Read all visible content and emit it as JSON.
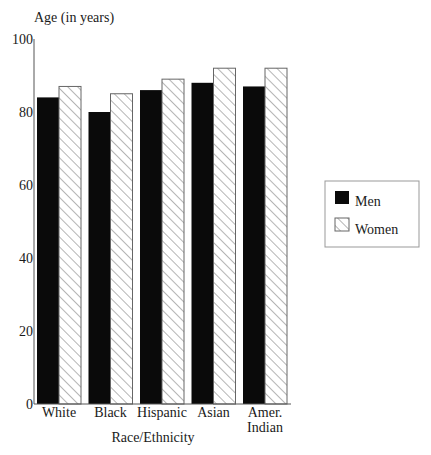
{
  "chart_data": {
    "type": "bar",
    "title": "",
    "ylabel": "Age (in years)",
    "xlabel": "Race/Ethnicity",
    "categories": [
      "White",
      "Black",
      "Hispanic",
      "Asian",
      "Amer. Indian"
    ],
    "category_lines": [
      [
        "White"
      ],
      [
        "Black"
      ],
      [
        "Hispanic"
      ],
      [
        "Asian"
      ],
      [
        "Amer.",
        "Indian"
      ]
    ],
    "series": [
      {
        "name": "Men",
        "values": [
          84,
          80,
          86,
          88,
          87
        ],
        "fill": "#0a0a0a",
        "pattern": "solid"
      },
      {
        "name": "Women",
        "values": [
          87,
          85,
          89,
          92,
          92
        ],
        "fill": "#ffffff",
        "pattern": "diagonal-hatch"
      }
    ],
    "ylim": [
      0,
      100
    ],
    "yticks": [
      0,
      20,
      40,
      60,
      80,
      100
    ],
    "grid": false,
    "legend_position": "right"
  },
  "legend": {
    "items": [
      {
        "label": "Men",
        "icon": "solid-black-swatch"
      },
      {
        "label": "Women",
        "icon": "hatched-swatch"
      }
    ]
  },
  "colors": {
    "men": "#0a0a0a",
    "women_hatch": "#777777",
    "axis": "#555555",
    "text": "#1a1a1a"
  }
}
